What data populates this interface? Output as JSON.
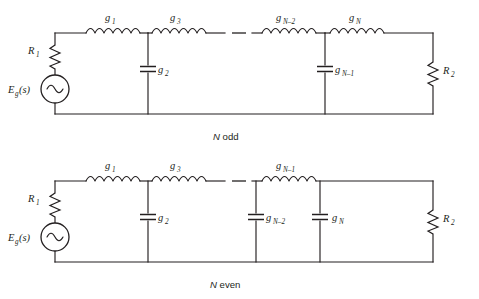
{
  "figure": {
    "background_color": "#ffffff",
    "line_color": "#231f20"
  },
  "circuits": [
    {
      "id": "n-odd",
      "caption": "N odd",
      "caption_variable": "N",
      "caption_word": "odd",
      "source": {
        "label": "E",
        "label_sub": "g",
        "label_suffix": "(s)",
        "symbol": "ac-source-sine"
      },
      "source_resistor": {
        "label": "R",
        "sub": "1"
      },
      "load_resistor": {
        "label": "R",
        "sub": "2"
      },
      "series_elements": [
        {
          "type": "inductor",
          "label": "g",
          "sub": "1"
        },
        {
          "type": "inductor",
          "label": "g",
          "sub": "3"
        },
        {
          "type": "ellipsis",
          "label": "–"
        },
        {
          "type": "inductor",
          "label": "g",
          "sub": "N–2"
        },
        {
          "type": "inductor",
          "label": "g",
          "sub": "N"
        }
      ],
      "shunt_elements": [
        {
          "type": "capacitor",
          "label": "g",
          "sub": "2"
        },
        {
          "type": "capacitor",
          "label": "g",
          "sub": "N–1"
        }
      ]
    },
    {
      "id": "n-even",
      "caption": "N even",
      "caption_variable": "N",
      "caption_word": "even",
      "source": {
        "label": "E",
        "label_sub": "g",
        "label_suffix": "(s)",
        "symbol": "ac-source-sine"
      },
      "source_resistor": {
        "label": "R",
        "sub": "1"
      },
      "load_resistor": {
        "label": "R",
        "sub": "2"
      },
      "series_elements": [
        {
          "type": "inductor",
          "label": "g",
          "sub": "1"
        },
        {
          "type": "inductor",
          "label": "g",
          "sub": "3"
        },
        {
          "type": "ellipsis",
          "label": "–"
        },
        {
          "type": "inductor",
          "label": "g",
          "sub": "N–1"
        }
      ],
      "shunt_elements": [
        {
          "type": "capacitor",
          "label": "g",
          "sub": "2"
        },
        {
          "type": "capacitor",
          "label": "g",
          "sub": "N–2"
        },
        {
          "type": "capacitor",
          "label": "g",
          "sub": "N"
        }
      ]
    }
  ]
}
